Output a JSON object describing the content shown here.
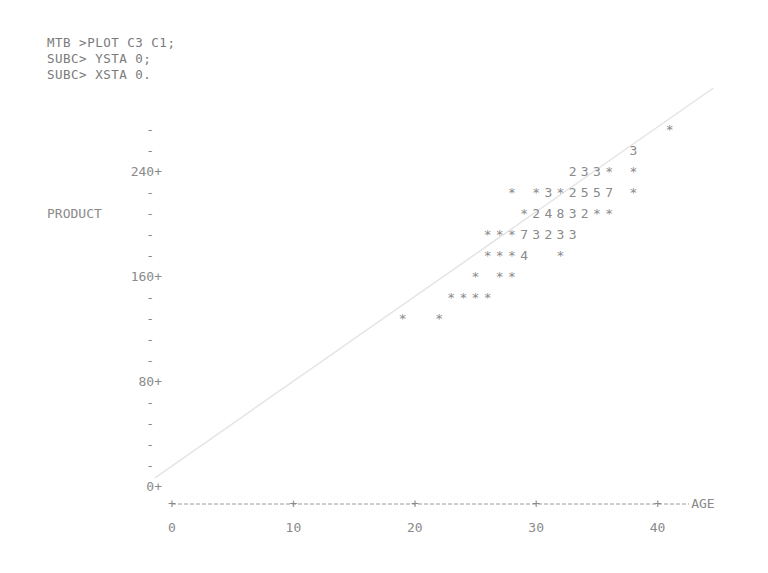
{
  "commands": [
    "MTB >PLOT C3 C1;",
    "SUBC> YSTA 0;",
    "SUBC> XSTA 0."
  ],
  "chart_data": {
    "type": "scatter",
    "style": "character-plot",
    "title": "",
    "xlabel": "AGE",
    "ylabel": "PRODUCT",
    "xlim": [
      0,
      45
    ],
    "ylim": [
      0,
      272
    ],
    "x_ticks": [
      0,
      10,
      20,
      30,
      40
    ],
    "x_tick_labels": [
      "0",
      "10",
      "20",
      "30",
      "40"
    ],
    "y_ticks": [
      0,
      80,
      160,
      240
    ],
    "y_tick_labels": [
      "0",
      "80",
      "160",
      "240"
    ],
    "y_minor_step": 16,
    "y_label_row_value": 208,
    "grid": false,
    "legend": "none",
    "note": "Digits indicate number of coincident points at that character cell; * = one point.",
    "rows": [
      {
        "y": 272,
        "cells": [
          {
            "x": 41,
            "s": "*"
          }
        ]
      },
      {
        "y": 256,
        "cells": [
          {
            "x": 38,
            "s": "3"
          }
        ]
      },
      {
        "y": 240,
        "cells": [
          {
            "x": 33,
            "s": "233*"
          },
          {
            "x": 38,
            "s": "*"
          }
        ]
      },
      {
        "y": 224,
        "cells": [
          {
            "x": 28,
            "s": "*"
          },
          {
            "x": 30,
            "s": "*3*2557"
          },
          {
            "x": 38,
            "s": "*"
          }
        ]
      },
      {
        "y": 208,
        "cells": [
          {
            "x": 29,
            "s": "*24832**"
          }
        ]
      },
      {
        "y": 192,
        "cells": [
          {
            "x": 26,
            "s": "***73233"
          }
        ]
      },
      {
        "y": 176,
        "cells": [
          {
            "x": 26,
            "s": "***4"
          },
          {
            "x": 32,
            "s": "*"
          }
        ]
      },
      {
        "y": 160,
        "cells": [
          {
            "x": 25,
            "s": "*"
          },
          {
            "x": 27,
            "s": "**"
          }
        ]
      },
      {
        "y": 144,
        "cells": [
          {
            "x": 23,
            "s": "****"
          }
        ]
      },
      {
        "y": 128,
        "cells": [
          {
            "x": 19,
            "s": "*"
          },
          {
            "x": 22,
            "s": "*"
          }
        ]
      }
    ],
    "fit_line": {
      "x": [
        -1.4,
        44.6
      ],
      "y": [
        7,
        304
      ]
    }
  },
  "colors": {
    "text": "#8a8a8a",
    "line": "#e4e4e4"
  }
}
